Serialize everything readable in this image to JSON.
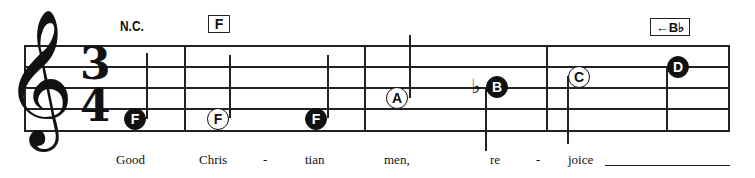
{
  "score": {
    "clef": "treble",
    "clef_glyph": "𝄞",
    "time_signature": {
      "top": "3",
      "bottom": "4"
    },
    "chords": [
      {
        "label": "N.C.",
        "boxed": false
      },
      {
        "label": "F",
        "boxed": true
      },
      {
        "label": "←B♭",
        "boxed": true
      }
    ],
    "measures": [
      {
        "notes": [
          {
            "letter": "F",
            "style": "filled",
            "duration": "half"
          }
        ]
      },
      {
        "notes": [
          {
            "letter": "F",
            "style": "open",
            "duration": "half"
          },
          {
            "letter": "F",
            "style": "filled",
            "duration": "quarter"
          }
        ]
      },
      {
        "notes": [
          {
            "letter": "A",
            "style": "open",
            "duration": "half"
          },
          {
            "letter": "B",
            "style": "filled",
            "duration": "quarter",
            "accidental": "♭"
          }
        ]
      },
      {
        "notes": [
          {
            "letter": "C",
            "style": "open",
            "duration": "half"
          },
          {
            "letter": "D",
            "style": "filled",
            "duration": "quarter"
          }
        ]
      }
    ],
    "lyrics": [
      "Good",
      "Chris",
      "-",
      "tian",
      "men,",
      "re",
      "-",
      "joice"
    ]
  }
}
